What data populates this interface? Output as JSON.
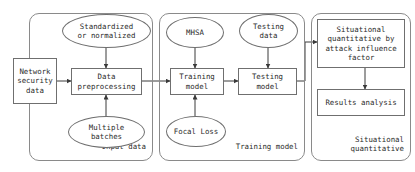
{
  "diagram": {
    "stroke_color": "#6f6f6f",
    "group_stroke_color": "#8a8a8a",
    "text_color": "#2b2b2b",
    "background": "#ffffff",
    "groups": [
      {
        "id": "input-data",
        "label": "Input data"
      },
      {
        "id": "training-model",
        "label": "Training model"
      },
      {
        "id": "situational-quantitative",
        "label": "Situational\nquantitative"
      }
    ],
    "nodes": [
      {
        "id": "standardized-or-normalized",
        "shape": "ellipse",
        "label": "Standardized\nor normalized"
      },
      {
        "id": "network-security-data",
        "shape": "rect",
        "label": "Network\nsecurity\ndata"
      },
      {
        "id": "data-preprocessing",
        "shape": "rect",
        "label": "Data\npreprocessing"
      },
      {
        "id": "multiple-batches",
        "shape": "ellipse",
        "label": "Multiple\nbatches"
      },
      {
        "id": "mhsa",
        "shape": "ellipse",
        "label": "MHSA"
      },
      {
        "id": "testing-data",
        "shape": "ellipse",
        "label": "Testing\ndata"
      },
      {
        "id": "training-model-node",
        "shape": "rect",
        "label": "Training\nmodel"
      },
      {
        "id": "testing-model-node",
        "shape": "rect",
        "label": "Testing\nmodel"
      },
      {
        "id": "focal-loss",
        "shape": "ellipse",
        "label": "Focal Loss"
      },
      {
        "id": "situational-quantitative-by-attack-influence-factor",
        "shape": "rect",
        "label": "Situational\nquantitative by\nattack influence\nfactor"
      },
      {
        "id": "results-analysis",
        "shape": "rect",
        "label": "Results analysis"
      }
    ],
    "edges": [
      {
        "from": "standardized-or-normalized",
        "to": "data-preprocessing"
      },
      {
        "from": "network-security-data",
        "to": "data-preprocessing"
      },
      {
        "from": "multiple-batches",
        "to": "data-preprocessing"
      },
      {
        "from": "data-preprocessing",
        "to": "training-model-node"
      },
      {
        "from": "mhsa",
        "to": "training-model-node"
      },
      {
        "from": "focal-loss",
        "to": "training-model-node"
      },
      {
        "from": "training-model-node",
        "to": "testing-model-node"
      },
      {
        "from": "testing-data",
        "to": "testing-model-node"
      },
      {
        "from": "testing-model-node",
        "to": "situational-quantitative-by-attack-influence-factor"
      },
      {
        "from": "situational-quantitative-by-attack-influence-factor",
        "to": "results-analysis"
      }
    ]
  }
}
